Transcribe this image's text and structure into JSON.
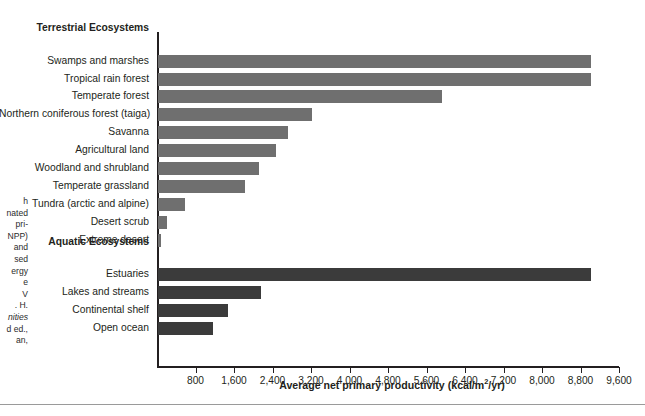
{
  "chart_data": {
    "type": "bar",
    "orientation": "horizontal",
    "title": "",
    "xlabel": "Average net primary productivity (kcal/m2/yr)",
    "xlabel_parts": {
      "pre": "Average net primary productivity (kcal/m",
      "sup": "2",
      "post": "/yr)"
    },
    "ylabel": "",
    "xlim": [
      0,
      9600
    ],
    "tick_step": 800,
    "grid": false,
    "legend": false,
    "tick_labels": [
      "800",
      "1,600",
      "2,400",
      "3,200",
      "4,000",
      "4,800",
      "5,600",
      "6,400",
      "7,200",
      "8,000",
      "8,800",
      "9,600"
    ],
    "tick_values": [
      800,
      1600,
      2400,
      3200,
      4000,
      4800,
      5600,
      6400,
      7200,
      8000,
      8800,
      9600
    ],
    "groups": [
      {
        "name": "Terrestrial Ecosystems",
        "color": "#6f6f6f",
        "categories": [
          "Swamps and marshes",
          "Tropical rain forest",
          "Temperate forest",
          "Northern coniferous forest (taiga)",
          "Savanna",
          "Agricultural land",
          "Woodland and shrubland",
          "Temperate grassland",
          "Tundra (arctic and alpine)",
          "Desert scrub",
          "Extreme desert"
        ],
        "values": [
          9000,
          9000,
          5900,
          3200,
          2700,
          2450,
          2100,
          1800,
          560,
          180,
          60
        ]
      },
      {
        "name": "Aquatic Ecosystems",
        "color": "#3b3b3b",
        "categories": [
          "Estuaries",
          "Lakes and streams",
          "Continental shelf",
          "Open ocean"
        ],
        "values": [
          9000,
          2150,
          1450,
          1150
        ]
      }
    ]
  },
  "caption": {
    "lines": [
      "h",
      "nated",
      "pri-",
      "NPP)",
      "and",
      "sed",
      "ergy",
      "e",
      "V",
      ". H.",
      "nities",
      "d ed.,",
      "an,"
    ],
    "italic_indices": [
      10
    ]
  },
  "colors": {
    "terrestrial_bar": "#6f6f6f",
    "aquatic_bar": "#3b3b3b",
    "axis": "#231f20",
    "text": "#231f20",
    "footer_rule": "#9a9a9a",
    "background": "#ffffff"
  }
}
